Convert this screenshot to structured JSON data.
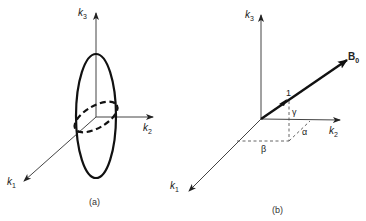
{
  "figure": {
    "panel_a": {
      "caption": "(a)",
      "axes": {
        "k1": {
          "base": "k",
          "sub": "1"
        },
        "k2": {
          "base": "k",
          "sub": "2"
        },
        "k3": {
          "base": "k",
          "sub": "3"
        }
      },
      "shapes": [
        "solid-vertical-ellipse",
        "dashed-tilted-ellipse"
      ]
    },
    "panel_b": {
      "caption": "(b)",
      "axes": {
        "k1": {
          "base": "k",
          "sub": "1"
        },
        "k2": {
          "base": "k",
          "sub": "2"
        },
        "k3": {
          "base": "k",
          "sub": "3"
        }
      },
      "vector": {
        "base": "B",
        "sub": "0"
      },
      "unit_mark": "1",
      "angles": {
        "gamma": "γ",
        "alpha": "α",
        "beta": "β"
      }
    },
    "colors": {
      "ink": "#1a1a1a",
      "axis": "#444444",
      "background": "#ffffff"
    }
  }
}
